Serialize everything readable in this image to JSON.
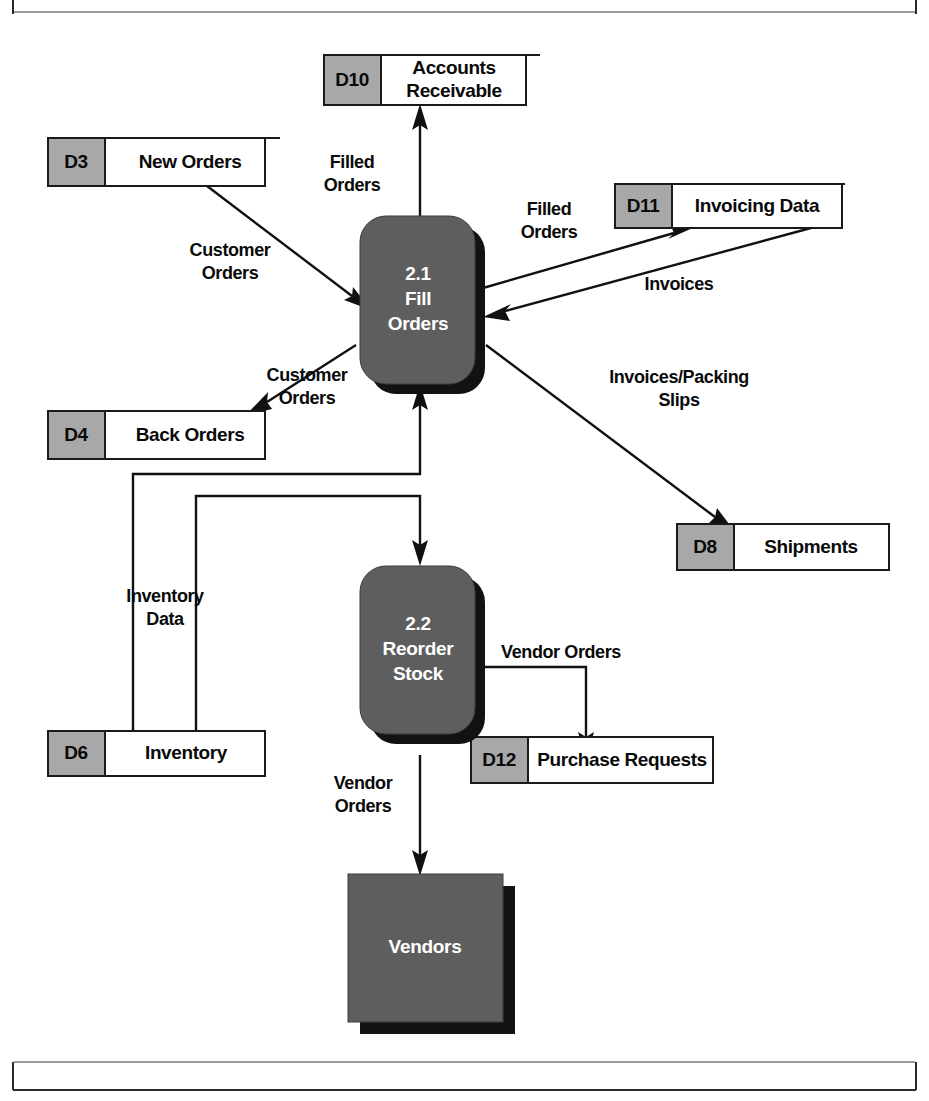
{
  "document": {
    "header_text": "",
    "page_number": ""
  },
  "diagram": {
    "type": "data-flow-diagram"
  },
  "data_stores": [
    {
      "id": "D10",
      "name": "Accounts Receivable",
      "name_line1": "Accounts",
      "name_line2": "Receivable"
    },
    {
      "id": "D3",
      "name": "New Orders",
      "name_line1": "New Orders",
      "name_line2": ""
    },
    {
      "id": "D11",
      "name": "Invoicing Data",
      "name_line1": "Invoicing Data",
      "name_line2": ""
    },
    {
      "id": "D4",
      "name": "Back Orders",
      "name_line1": "Back Orders",
      "name_line2": ""
    },
    {
      "id": "D8",
      "name": "Shipments",
      "name_line1": "Shipments",
      "name_line2": ""
    },
    {
      "id": "D6",
      "name": "Inventory",
      "name_line1": "Inventory",
      "name_line2": ""
    },
    {
      "id": "D12",
      "name": "Purchase Requests",
      "name_line1": "Purchase Requests",
      "name_line2": ""
    }
  ],
  "processes": [
    {
      "number": "2.1",
      "name": "Fill Orders",
      "name_line1": "Fill",
      "name_line2": "Orders"
    },
    {
      "number": "2.2",
      "name": "Reorder Stock",
      "name_line1": "Reorder",
      "name_line2": "Stock"
    }
  ],
  "external_entities": [
    {
      "name": "Vendors"
    }
  ],
  "flows": [
    {
      "label": "Filled Orders",
      "line1": "Filled",
      "line2": "Orders",
      "from": "2.1",
      "to": "D10"
    },
    {
      "label": "Customer Orders",
      "line1": "Customer",
      "line2": "Orders",
      "from": "D3",
      "to": "2.1"
    },
    {
      "label": "Filled Orders",
      "line1": "Filled",
      "line2": "Orders",
      "from": "2.1",
      "to": "D11"
    },
    {
      "label": "Invoices",
      "line1": "Invoices",
      "line2": "",
      "from": "D11",
      "to": "2.1"
    },
    {
      "label": "Customer Orders",
      "line1": "Customer",
      "line2": "Orders",
      "from": "2.1",
      "to": "D4"
    },
    {
      "label": "Invoices/Packing Slips",
      "line1": "Invoices/Packing",
      "line2": "Slips",
      "from": "2.1",
      "to": "D8"
    },
    {
      "label": "Inventory Data",
      "line1": "Inventory",
      "line2": "Data",
      "from": "D6",
      "to": "2.1"
    },
    {
      "label": "Vendor Orders",
      "line1": "Vendor Orders",
      "line2": "",
      "from": "2.2",
      "to": "D12"
    },
    {
      "label": "Vendor Orders",
      "line1": "Vendor",
      "line2": "Orders",
      "from": "2.2",
      "to": "Vendors"
    }
  ],
  "colors": {
    "process_fill": "#5e5e5e",
    "entity_fill": "#5e5e5e",
    "store_id_fill": "#a8a8a8",
    "store_name_fill": "#ffffff",
    "line": "#111111",
    "shadow": "#121212",
    "text_dark": "#0a0a0a",
    "text_light": "#ffffff"
  }
}
